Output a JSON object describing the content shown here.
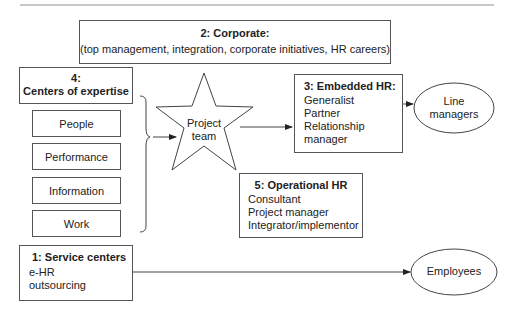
{
  "corporate": {
    "title": "2: Corporate:",
    "description": "(top management, integration, corporate initiatives, HR careers)"
  },
  "centers_of_expertise": {
    "title_line1": "4:",
    "title_line2": "Centers of expertise",
    "items": [
      "People",
      "Performance",
      "Information",
      "Work"
    ]
  },
  "project_team": {
    "line1": "Project",
    "line2": "team"
  },
  "embedded_hr": {
    "title": "3: Embedded HR:",
    "items": [
      "Generalist",
      "Partner",
      "Relationship",
      "manager"
    ]
  },
  "line_managers": {
    "line1": "Line",
    "line2": "managers"
  },
  "operational_hr": {
    "title": "5: Operational HR",
    "items": [
      "Consultant",
      "Project manager",
      "Integrator/implementor"
    ]
  },
  "service_centers": {
    "title": "1: Service centers",
    "items": [
      "e-HR",
      "outsourcing"
    ]
  },
  "employees": {
    "label": "Employees"
  }
}
